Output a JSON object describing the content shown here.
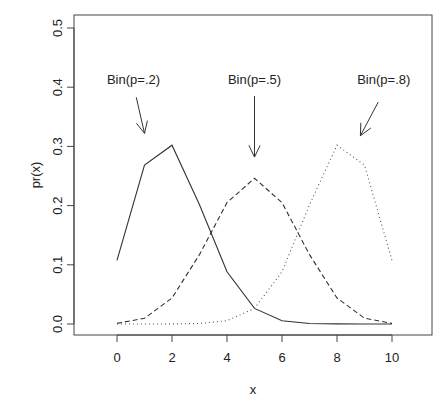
{
  "chart_data": {
    "type": "line",
    "title": "",
    "xlabel": "x",
    "ylabel": "pr(x)",
    "xlim": [
      -1.5,
      11.5
    ],
    "ylim": [
      -0.018,
      0.52
    ],
    "x_ticks": [
      0,
      2,
      4,
      6,
      8,
      10
    ],
    "x_tick_labels": [
      "0",
      "2",
      "4",
      "6",
      "8",
      "10"
    ],
    "y_ticks": [
      0.0,
      0.1,
      0.2,
      0.3,
      0.4,
      0.5
    ],
    "y_tick_labels": [
      "0.0",
      "0.1",
      "0.2",
      "0.3",
      "0.4",
      "0.5"
    ],
    "grid": false,
    "legend": null,
    "x": [
      0,
      1,
      2,
      3,
      4,
      5,
      6,
      7,
      8,
      9,
      10
    ],
    "series": [
      {
        "name": "Bin(p=.2)",
        "line_style": "solid",
        "color": "#333333",
        "values": [
          0.1074,
          0.2684,
          0.302,
          0.2013,
          0.0881,
          0.0264,
          0.0055,
          0.0008,
          0.0001,
          0.0,
          0.0
        ]
      },
      {
        "name": "Bin(p=.5)",
        "line_style": "dashed",
        "color": "#333333",
        "values": [
          0.001,
          0.0098,
          0.0439,
          0.1172,
          0.2051,
          0.2461,
          0.2051,
          0.1172,
          0.0439,
          0.0098,
          0.001
        ]
      },
      {
        "name": "Bin(p=.8)",
        "line_style": "dotted",
        "color": "#555555",
        "values": [
          0.0,
          0.0,
          0.0001,
          0.0008,
          0.0055,
          0.0264,
          0.0881,
          0.2013,
          0.302,
          0.2684,
          0.1074
        ]
      }
    ],
    "annotations": [
      {
        "text": "Bin(p=.2)",
        "text_x": 0.6,
        "text_y": 0.405,
        "arrow_from": [
          0.7,
          0.383
        ],
        "arrow_to": [
          1.0,
          0.322
        ]
      },
      {
        "text": "Bin(p=.5)",
        "text_x": 5.0,
        "text_y": 0.405,
        "arrow_from": [
          5.0,
          0.385
        ],
        "arrow_to": [
          5.0,
          0.282
        ]
      },
      {
        "text": "Bin(p=.8)",
        "text_x": 9.7,
        "text_y": 0.405,
        "arrow_from": [
          9.5,
          0.375
        ],
        "arrow_to": [
          8.85,
          0.318
        ]
      }
    ]
  }
}
